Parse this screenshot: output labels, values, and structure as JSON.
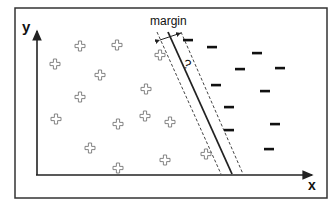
{
  "diagram": {
    "axis_x_label": "x",
    "axis_y_label": "y",
    "margin_label": "margin",
    "question_label": "?",
    "colors": {
      "stroke": "#222222",
      "plus": "#777777",
      "dashed": "#444444"
    },
    "positive_class_symbol": "+",
    "negative_class_symbol": "-",
    "positive_points": [
      [
        80,
        46
      ],
      [
        117,
        45
      ],
      [
        160,
        55
      ],
      [
        55,
        64
      ],
      [
        100,
        75
      ],
      [
        146,
        89
      ],
      [
        80,
        97
      ],
      [
        56,
        119
      ],
      [
        118,
        124
      ],
      [
        145,
        116
      ],
      [
        170,
        122
      ],
      [
        90,
        148
      ],
      [
        165,
        160
      ],
      [
        206,
        154
      ],
      [
        118,
        168
      ]
    ],
    "negative_points": [
      [
        188,
        40
      ],
      [
        212,
        47
      ],
      [
        257,
        53
      ],
      [
        240,
        69
      ],
      [
        280,
        68
      ],
      [
        216,
        85
      ],
      [
        265,
        91
      ],
      [
        229,
        107
      ],
      [
        275,
        124
      ],
      [
        229,
        130
      ],
      [
        269,
        149
      ]
    ],
    "decision_boundary": {
      "x1": 168,
      "y1": 32,
      "x2": 232,
      "y2": 174
    },
    "margin_lines": [
      {
        "x1": 157,
        "y1": 32,
        "x2": 221,
        "y2": 174
      },
      {
        "x1": 181,
        "y1": 32,
        "x2": 243,
        "y2": 174
      }
    ]
  }
}
